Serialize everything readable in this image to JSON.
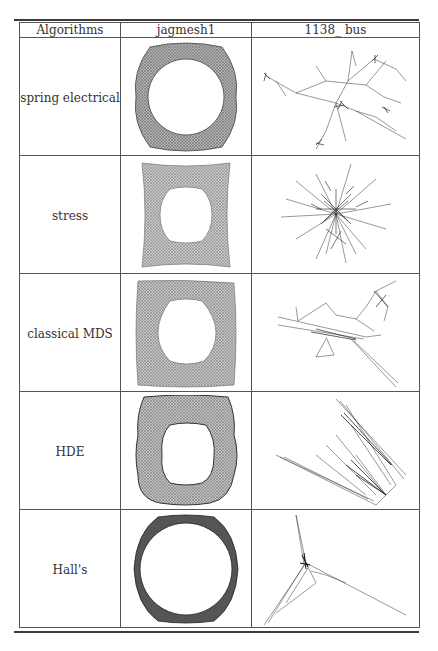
{
  "table": {
    "headers": [
      "Algorithms",
      "jagmesh1",
      "1138_bus"
    ],
    "header_display": [
      "Algorithms",
      "jagmesh1",
      "1138_ bus"
    ],
    "rows": [
      {
        "algorithm": "spring electrical",
        "jagmesh1": "ring-shaped mesh drawing, rounded square outer boundary, circular hole",
        "bus": "sparse branching tree-like drawing with several clusters"
      },
      {
        "algorithm": "stress",
        "jagmesh1": "uniform square-shaped mesh with rounded square hole",
        "bus": "dense bushy cluster with radiating branches"
      },
      {
        "algorithm": "classical MDS",
        "jagmesh1": "square mesh with rounded hole, slightly distorted",
        "bus": "elongated drawing with long spike toward bottom-right"
      },
      {
        "algorithm": "HDE",
        "jagmesh1": "distorted mesh, bucket-like shape, dense at edges",
        "bus": "fan-shaped drawing compressed along diagonal lines"
      },
      {
        "algorithm": "Hall's",
        "jagmesh1": "thin dense ring, nearly circular",
        "bus": "three-armed star with dense center"
      }
    ]
  }
}
